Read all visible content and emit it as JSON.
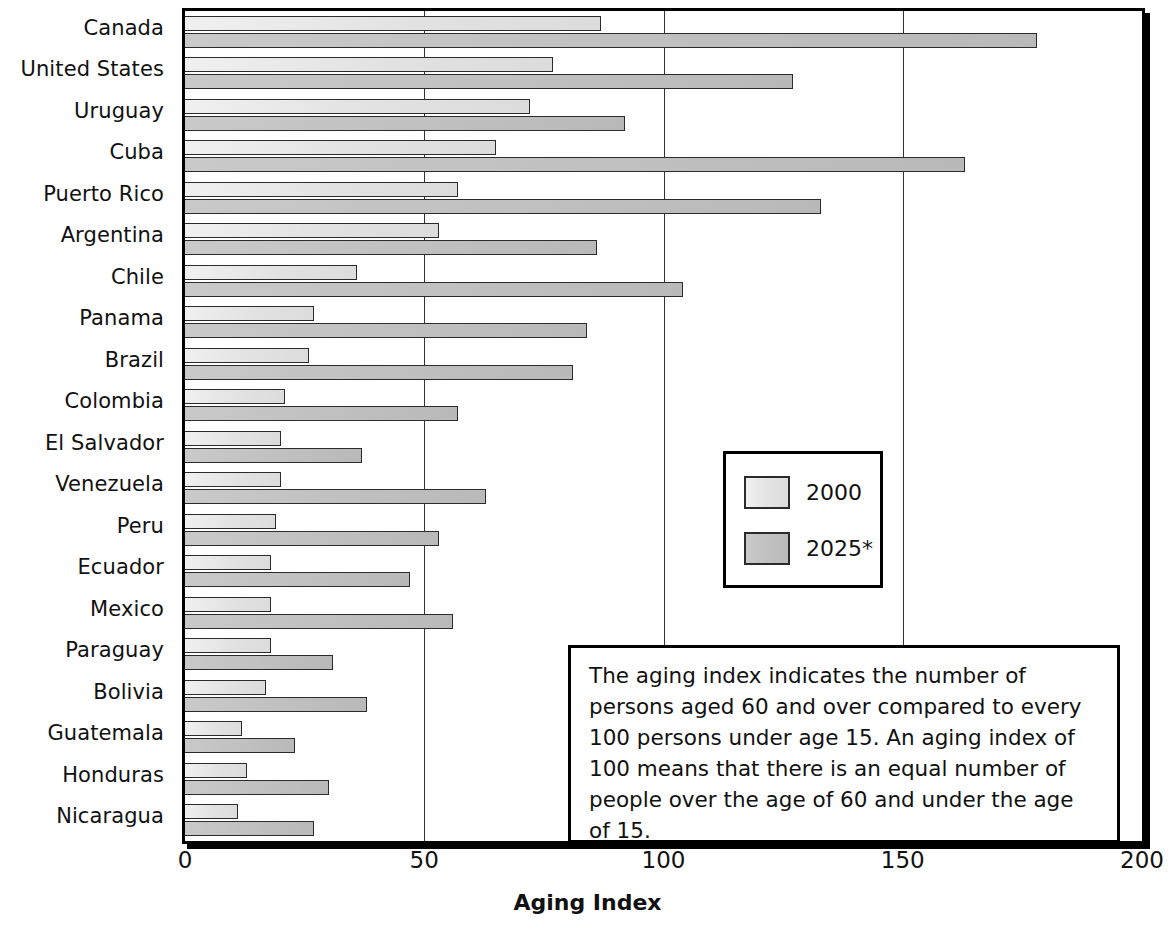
{
  "chart_data": {
    "type": "bar",
    "orientation": "horizontal",
    "title": "",
    "xlabel": "Aging Index",
    "ylabel": "",
    "xlim": [
      0,
      200
    ],
    "xticks": [
      0,
      50,
      100,
      150,
      200
    ],
    "xtick_labels": [
      "0",
      "50",
      "100",
      "150",
      "200"
    ],
    "grid": "vertical gridlines at 50, 100, 150",
    "legend_position": "middle-right inside plot",
    "categories": [
      "Canada",
      "United States",
      "Uruguay",
      "Cuba",
      "Puerto Rico",
      "Argentina",
      "Chile",
      "Panama",
      "Brazil",
      "Colombia",
      "El Salvador",
      "Venezuela",
      "Peru",
      "Ecuador",
      "Mexico",
      "Paraguay",
      "Bolivia",
      "Guatemala",
      "Honduras",
      "Nicaragua"
    ],
    "series": [
      {
        "name": "2000",
        "color": "#e4e4e4",
        "values": [
          87,
          77,
          72,
          65,
          57,
          53,
          36,
          27,
          26,
          21,
          20,
          20,
          19,
          18,
          18,
          18,
          17,
          12,
          13,
          11
        ]
      },
      {
        "name": "2025*",
        "color": "#bfbfbf",
        "values": [
          178,
          127,
          92,
          163,
          133,
          86,
          104,
          84,
          81,
          57,
          37,
          63,
          53,
          47,
          56,
          31,
          38,
          23,
          30,
          27
        ]
      }
    ]
  },
  "legend": {
    "items": [
      {
        "label": "2000"
      },
      {
        "label": "2025*"
      }
    ]
  },
  "note": {
    "text": "The aging index indicates the number of persons aged 60 and over compared to every 100 persons under age 15. An aging index of 100 means that there is an equal number of people over the age of 60 and under the age of 15."
  },
  "axis": {
    "x_title": "Aging Index"
  }
}
